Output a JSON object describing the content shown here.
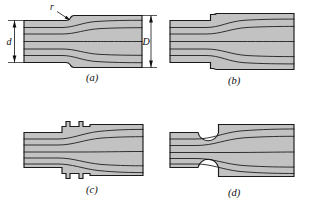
{
  "figure": {
    "background_color": "#ffffff",
    "body_fill_color": "#c2c2c2",
    "outline_color": "#1a1a1a",
    "flow_line_color": "#141414",
    "panel_count": 4
  },
  "annotations": {
    "radius_label": "r",
    "small_diameter_label": "d",
    "large_diameter_label": "D"
  },
  "panels": [
    {
      "id": "a",
      "caption": "(a)",
      "description": "stepped shaft with generous fillet radius",
      "shoulder_type": "fillet-radius",
      "has_radius_callout": true,
      "has_d_dimension": true,
      "has_D_dimension": true,
      "flow_line_count": 5
    },
    {
      "id": "b",
      "caption": "(b)",
      "description": "stepped shaft with small relief notch at shoulder",
      "shoulder_type": "relief-notch",
      "has_radius_callout": false,
      "has_d_dimension": false,
      "has_D_dimension": false,
      "flow_line_count": 5
    },
    {
      "id": "c",
      "caption": "(c)",
      "description": "stepped shaft with twin square relief grooves",
      "shoulder_type": "twin-square-grooves",
      "has_radius_callout": false,
      "has_d_dimension": false,
      "has_D_dimension": false,
      "flow_line_count": 5
    },
    {
      "id": "d",
      "caption": "(d)",
      "description": "stepped shaft with large circular undercut groove",
      "shoulder_type": "circular-undercut",
      "has_radius_callout": false,
      "has_d_dimension": false,
      "has_D_dimension": false,
      "flow_line_count": 5
    }
  ]
}
